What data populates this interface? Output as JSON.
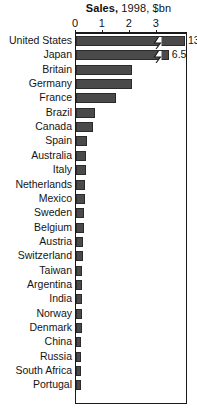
{
  "chart_data": {
    "type": "bar",
    "title": "Sales, 1998, $bn",
    "title_bold_part": "Sales,",
    "title_rest": "1998, $bn",
    "orientation": "horizontal",
    "xlabel": "",
    "ylabel": "",
    "xlim": [
      0,
      4.15
    ],
    "axis_ticks": [
      0,
      1,
      2,
      3
    ],
    "axis_tick_labels": [
      "0",
      "1",
      "2",
      "3"
    ],
    "grid": false,
    "legend": null,
    "bar_color": "#4a4a4a",
    "note": "Top two bars are truncated with axis-break marks; their true values are printed at the bar ends.",
    "categories": [
      "United States",
      "Japan",
      "Britain",
      "Germany",
      "France",
      "Brazil",
      "Canada",
      "Spain",
      "Australia",
      "Italy",
      "Netherlands",
      "Mexico",
      "Sweden",
      "Belgium",
      "Austria",
      "Switzerland",
      "Taiwan",
      "Argentina",
      "India",
      "Norway",
      "Denmark",
      "China",
      "Russia",
      "South Africa",
      "Portugal"
    ],
    "values": [
      13.2,
      6.5,
      2.1,
      2.1,
      1.5,
      0.72,
      0.62,
      0.42,
      0.38,
      0.36,
      0.35,
      0.32,
      0.3,
      0.28,
      0.27,
      0.25,
      0.24,
      0.23,
      0.22,
      0.22,
      0.21,
      0.2,
      0.2,
      0.19,
      0.18
    ],
    "truncated_bars": [
      {
        "category": "United States",
        "drawn_to": 4.05,
        "value_label": "13.2",
        "break_at": 2.85
      },
      {
        "category": "Japan",
        "drawn_to": 3.45,
        "value_label": "6.5",
        "break_at": 2.85
      }
    ]
  }
}
